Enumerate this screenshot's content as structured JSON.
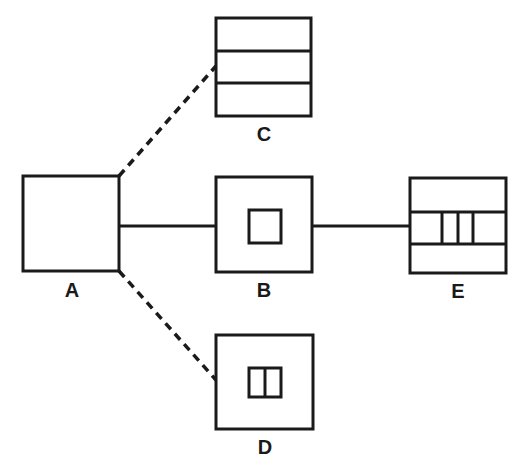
{
  "diagram": {
    "colors": {
      "stroke": "#1a1a1a",
      "background": "#ffffff"
    },
    "nodes": [
      {
        "id": "A",
        "label": "A",
        "content": "empty square"
      },
      {
        "id": "B",
        "label": "B",
        "content": "square with inner small square"
      },
      {
        "id": "C",
        "label": "C",
        "content": "square divided into three horizontal bands"
      },
      {
        "id": "D",
        "label": "D",
        "content": "square with inner small rectangle split in two"
      },
      {
        "id": "E",
        "label": "E",
        "content": "square with three horizontal bands, middle band split by three vertical lines"
      }
    ],
    "edges": [
      {
        "from": "A",
        "to": "B",
        "style": "solid"
      },
      {
        "from": "B",
        "to": "E",
        "style": "solid"
      },
      {
        "from": "A",
        "to": "C",
        "style": "dashed"
      },
      {
        "from": "A",
        "to": "D",
        "style": "dashed"
      }
    ]
  }
}
